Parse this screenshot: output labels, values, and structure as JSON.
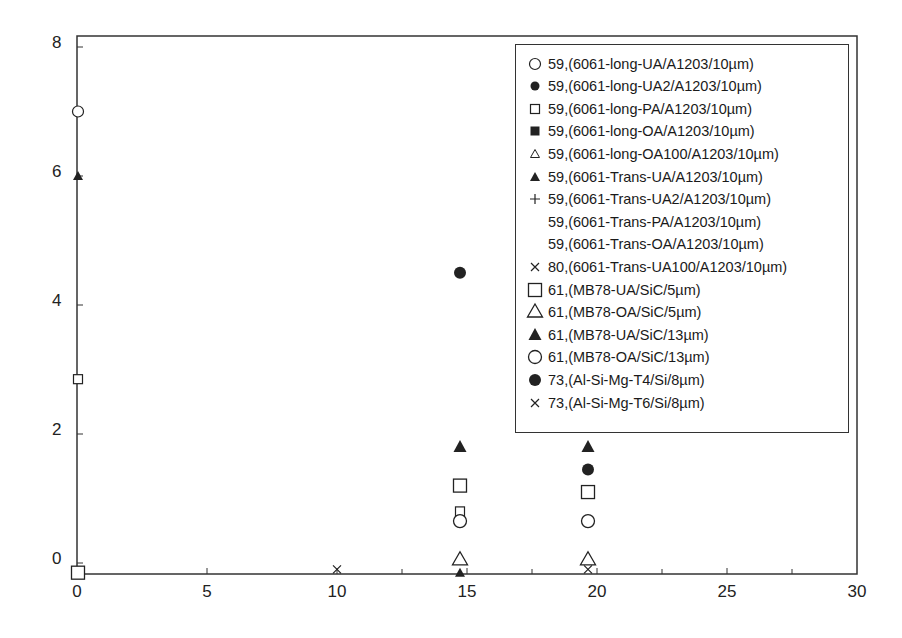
{
  "chart_data": {
    "type": "scatter",
    "title": "",
    "xlabel": "",
    "ylabel": "",
    "xlim": [
      0,
      30
    ],
    "ylim": [
      -0.2,
      8
    ],
    "x_ticks": [
      "0",
      "5",
      "10",
      "15",
      "20",
      "25",
      "30"
    ],
    "y_ticks": [
      "0",
      "2",
      "4",
      "6",
      "8"
    ],
    "grid": false,
    "legend_position": "upper right",
    "series": [
      {
        "name": "59,(6061-long-UA/A1203/10µm)",
        "marker": "circle-open-small",
        "points": [
          [
            0,
            7.0
          ]
        ]
      },
      {
        "name": "59,(6061-long-UA2/A1203/10µm)",
        "marker": "circle-filled-small",
        "points": []
      },
      {
        "name": "59,(6061-long-PA/A1203/10µm)",
        "marker": "square-open-small",
        "points": [
          [
            0,
            2.85
          ],
          [
            15,
            0.8
          ]
        ]
      },
      {
        "name": "59,(6061-long-OA/A1203/10µm)",
        "marker": "square-filled-small",
        "points": []
      },
      {
        "name": "59,(6061-long-OA100/A1203/10µm)",
        "marker": "triangle-open-small",
        "points": []
      },
      {
        "name": "59,(6061-Trans-UA/A1203/10µm)",
        "marker": "triangle-filled-small",
        "points": [
          [
            0,
            6.0
          ],
          [
            15,
            -0.15
          ]
        ]
      },
      {
        "name": "59,(6061-Trans-UA2/A1203/10µm)",
        "marker": "plus",
        "points": []
      },
      {
        "name": "59,(6061-Trans-PA/A1203/10µm)",
        "marker": "none",
        "points": []
      },
      {
        "name": "59,(6061-Trans-OA/A1203/10µm)",
        "marker": "none",
        "points": []
      },
      {
        "name": "80,(6061-Trans-UA100/A1203/10µm)",
        "marker": "x-small",
        "points": [
          [
            10,
            -0.1
          ]
        ]
      },
      {
        "name": "61,(MB78-UA/SiC/5µm)",
        "marker": "square-open",
        "points": [
          [
            0,
            -0.15
          ],
          [
            15,
            1.2
          ],
          [
            20,
            1.1
          ]
        ]
      },
      {
        "name": "61,(MB78-OA/SiC/5µm)",
        "marker": "triangle-open",
        "points": [
          [
            15,
            0.05
          ],
          [
            20,
            0.05
          ]
        ]
      },
      {
        "name": "61,(MB78-UA/SiC/13µm)",
        "marker": "triangle-filled",
        "points": [
          [
            15,
            1.8
          ],
          [
            20,
            1.8
          ]
        ]
      },
      {
        "name": "61,(MB78-OA/SiC/13µm)",
        "marker": "circle-open",
        "points": [
          [
            15,
            0.65
          ],
          [
            20,
            0.65
          ]
        ]
      },
      {
        "name": "73,(Al-Si-Mg-T4/Si/8µm)",
        "marker": "circle-filled",
        "points": [
          [
            15,
            4.5
          ],
          [
            20,
            1.45
          ]
        ]
      },
      {
        "name": "73,(Al-Si-Mg-T6/Si/8µm)",
        "marker": "x-small",
        "points": [
          [
            20,
            -0.1
          ]
        ]
      }
    ]
  }
}
